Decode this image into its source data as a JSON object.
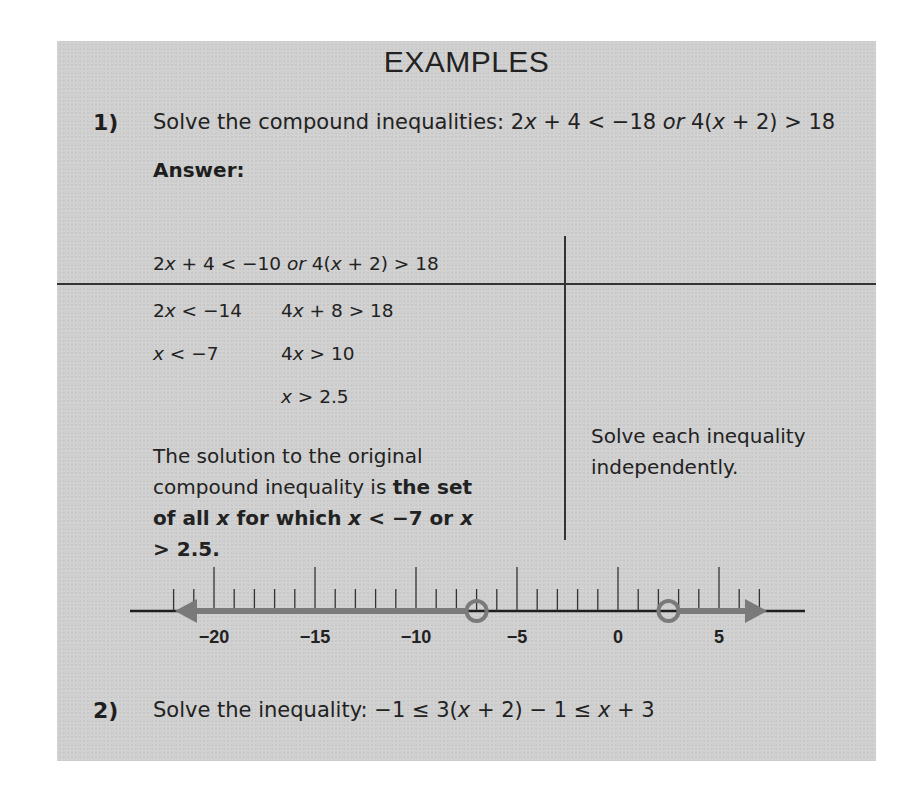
{
  "heading": "EXAMPLES",
  "example1": {
    "number": "1)",
    "prompt_prefix": "Solve the compound inequalities: ",
    "prompt_math": {
      "a": "2",
      "x": "x",
      "b": " + 4 < −18 ",
      "or": "or",
      "c": " 4(",
      "d": " + 2) > 18"
    },
    "answer_label": "Answer:",
    "restated": {
      "a": "2",
      "b": " + 4 < −10 ",
      "or": "or",
      "c": " 4(",
      "d": " + 2) > 18"
    },
    "steps_left": [
      {
        "pre": "2",
        "post": " < −14"
      },
      {
        "pre": "",
        "post": " < −7"
      }
    ],
    "steps_right": [
      {
        "pre": "4",
        "post": " + 8 > 18"
      },
      {
        "pre": "4",
        "post": " > 10"
      },
      {
        "pre": "",
        "post": " > 2.5"
      }
    ],
    "solution": {
      "plain": "The solution to the original compound inequality is ",
      "bold_a": "the set of all ",
      "bold_b": " for which ",
      "bold_c": " < −7 or ",
      "bold_d": " > 2.5."
    },
    "note": "Solve each inequality independently."
  },
  "chart_data": {
    "type": "number_line",
    "axis_range": [
      -22,
      7
    ],
    "major_ticks": [
      -20,
      -15,
      -10,
      -5,
      0,
      5
    ],
    "tick_labels": [
      "−20",
      "−15",
      "−10",
      "−5",
      "0",
      "5"
    ],
    "open_points": [
      -7,
      2.5
    ],
    "shaded_rays": [
      {
        "from": -7,
        "direction": "left"
      },
      {
        "from": 2.5,
        "direction": "right"
      }
    ],
    "colors": {
      "axis": "#1e1e1e",
      "ray": "#7a7a7a",
      "tick": "#333333"
    }
  },
  "example2": {
    "number": "2)",
    "prompt_prefix": "Solve the inequality: ",
    "prompt_math": {
      "a": "−1 ≤ 3(",
      "b": " + 2) − 1 ≤ ",
      "c": " + 3"
    }
  }
}
